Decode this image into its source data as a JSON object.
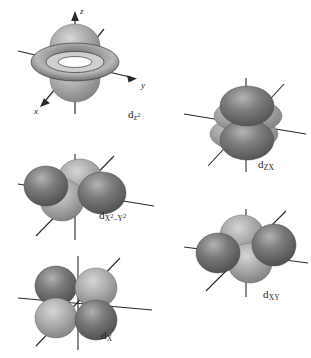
{
  "figure": {
    "background_color": "#ffffff",
    "lobe_dark_color": "#6f6f6f",
    "lobe_light_color": "#9d9d9d",
    "axis_color": "#2a2a2a",
    "label_color": "#1f1f1f"
  },
  "axes": {
    "z_label": "z",
    "y_label": "y",
    "x_label": "x"
  },
  "orbitals": [
    {
      "id": "dz2",
      "label_main": "d",
      "label_sub": "z",
      "label_sup": "2",
      "description": "two lobes along z with toroidal ring in xy plane",
      "has_axis_labels": true
    },
    {
      "id": "dzx",
      "label_main": "d",
      "label_sub": "ZX",
      "label_sup": "",
      "description": "two lobes stacked vertically in the zx plane",
      "has_axis_labels": false
    },
    {
      "id": "dx2-y2",
      "label_main": "d",
      "label_sub_parts": [
        "X",
        "2",
        "–Y",
        "2"
      ],
      "description": "four lobes directed along x and y axes",
      "has_axis_labels": false
    },
    {
      "id": "dxy",
      "label_main": "d",
      "label_sub": "XY",
      "label_sup": "",
      "description": "four lobes between x and y axes, viewed edge on",
      "has_axis_labels": false
    },
    {
      "id": "dx",
      "label_main": "d",
      "label_sub": "X",
      "label_sup": "",
      "description": "four lobe cloverleaf between axes",
      "has_axis_labels": false
    }
  ]
}
